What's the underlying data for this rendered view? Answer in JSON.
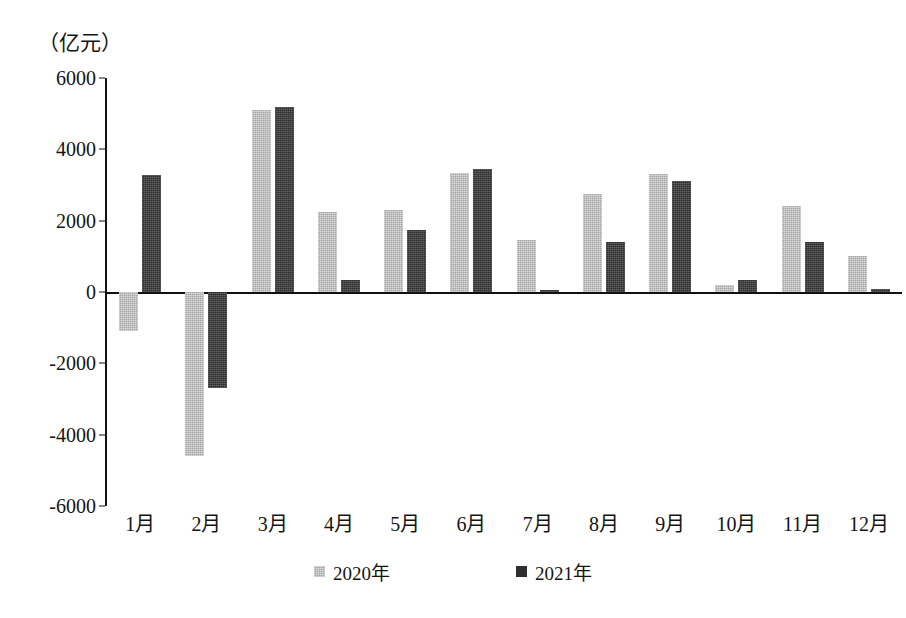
{
  "chart_data": {
    "type": "bar",
    "title": "（亿元）",
    "subtitle": "",
    "xlabel": "",
    "ylabel": "（亿元）",
    "ylim": [
      -6000,
      6000
    ],
    "yticks": [
      6000,
      4000,
      2000,
      0,
      -2000,
      -4000,
      -6000
    ],
    "ytick_labels": [
      "6000",
      "4000",
      "2000",
      "0",
      "-2000",
      "-4000",
      "-6000"
    ],
    "grid": false,
    "legend_position": "bottom",
    "categories": [
      "1月",
      "2月",
      "3月",
      "4月",
      "5月",
      "6月",
      "7月",
      "8月",
      "9月",
      "10月",
      "11月",
      "12月"
    ],
    "series": [
      {
        "name": "2020年",
        "color": "#a6a6a6",
        "values": [
          -1100,
          -4600,
          5100,
          2250,
          2300,
          3350,
          1450,
          2750,
          3300,
          200,
          2400,
          1000
        ]
      },
      {
        "name": "2021年",
        "color": "#2e2e2e",
        "values": [
          3280,
          -2700,
          5200,
          330,
          1750,
          3450,
          50,
          1400,
          3100,
          330,
          1400,
          80
        ]
      }
    ]
  },
  "legend": {
    "items": [
      {
        "label": "2020年",
        "swatch": "gray-square-icon"
      },
      {
        "label": "2021年",
        "swatch": "dark-square-icon"
      }
    ]
  }
}
